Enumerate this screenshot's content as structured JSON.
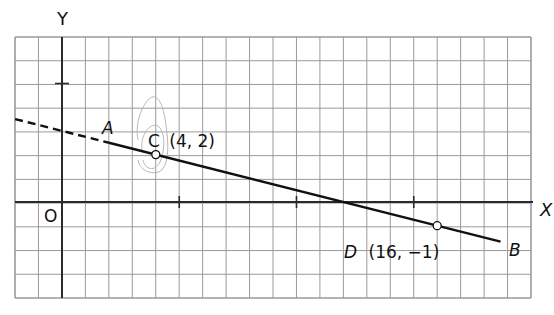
{
  "figure": {
    "width": 554,
    "height": 315,
    "colors": {
      "background": "#ffffff",
      "grid": "#9a9a9a",
      "axis": "#2a2a2a",
      "line": "#111111",
      "point_fill": "#ffffff",
      "scribble": "#b8b8b8"
    },
    "grid": {
      "left": 15,
      "top": 37,
      "right": 531,
      "bottom": 298,
      "columns": 22,
      "rows": 11
    },
    "origin_px": {
      "x": 62,
      "y": 202
    },
    "unit_px": {
      "x": 23.45,
      "y": 23.7
    }
  },
  "axes": {
    "x_label": "X",
    "y_label": "Y",
    "origin_label": "O",
    "x_ticks": [
      5,
      10,
      15
    ],
    "y_ticks": [
      5
    ]
  },
  "line": {
    "equation_points": [
      "C",
      "D"
    ],
    "dashed_from_x": -2,
    "dashed_to_x": 2,
    "solid_from_x": 2,
    "solid_to_x": 18.7,
    "end_labels": {
      "start": "A",
      "end": "B"
    }
  },
  "points": [
    {
      "id": "C",
      "label": "C (4, 2)",
      "name": "C",
      "coords": "(4, 2)",
      "x": 4,
      "y": 2
    },
    {
      "id": "D",
      "label": "D (16, −1)",
      "name": "D",
      "coords": "(16, −1)",
      "x": 16,
      "y": -1
    }
  ]
}
